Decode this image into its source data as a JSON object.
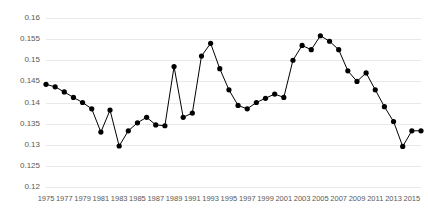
{
  "chart_data": {
    "type": "line",
    "title": "",
    "subtitle": "",
    "xlabel": "",
    "ylabel": "",
    "xlim": [
      1975,
      2016
    ],
    "ylim": [
      0.12,
      0.16
    ],
    "yticks": [
      0.12,
      0.125,
      0.13,
      0.135,
      0.14,
      0.145,
      0.15,
      0.155,
      0.16
    ],
    "ytick_labels": [
      "0.12",
      "0.125",
      "0.13",
      "0.135",
      "0.14",
      "0.145",
      "0.15",
      "0.155",
      "0.16"
    ],
    "xticks": [
      1975,
      1977,
      1979,
      1981,
      1983,
      1985,
      1987,
      1989,
      1991,
      1993,
      1995,
      1997,
      1999,
      2001,
      2003,
      2005,
      2007,
      2009,
      2011,
      2013,
      2015
    ],
    "xtick_labels": [
      "1975",
      "1977",
      "1979",
      "1981",
      "1983",
      "1985",
      "1987",
      "1989",
      "1991",
      "1993",
      "1995",
      "1997",
      "1999",
      "2001",
      "2003",
      "2005",
      "2007",
      "2009",
      "2011",
      "2013",
      "2015"
    ],
    "grid": true,
    "grid_axis": "y",
    "legend": false,
    "legend_position": "none",
    "marker": "circle",
    "line_color": "#000000",
    "marker_color": "#000000",
    "grid_color": "#e9e9e9",
    "background_color": "#ffffff",
    "tick_label_color": "#595959",
    "x": [
      1975,
      1976,
      1977,
      1978,
      1979,
      1980,
      1981,
      1982,
      1983,
      1984,
      1985,
      1986,
      1987,
      1988,
      1989,
      1990,
      1991,
      1992,
      1993,
      1994,
      1995,
      1996,
      1997,
      1998,
      1999,
      2000,
      2001,
      2002,
      2003,
      2004,
      2005,
      2006,
      2007,
      2008,
      2009,
      2010,
      2011,
      2012,
      2013,
      2014,
      2015,
      2016
    ],
    "values": [
      0.1443,
      0.1437,
      0.1425,
      0.1412,
      0.14,
      0.1385,
      0.133,
      0.1382,
      0.1297,
      0.1333,
      0.1352,
      0.1365,
      0.1347,
      0.1345,
      0.1485,
      0.1365,
      0.1375,
      0.151,
      0.154,
      0.148,
      0.143,
      0.1393,
      0.1385,
      0.14,
      0.141,
      0.142,
      0.1412,
      0.15,
      0.1535,
      0.1525,
      0.1558,
      0.1545,
      0.1525,
      0.1475,
      0.145,
      0.147,
      0.143,
      0.139,
      0.1355,
      0.1296,
      0.1333,
      0.1333
    ],
    "series": [
      {
        "name": "series-1",
        "values": [
          0.1443,
          0.1437,
          0.1425,
          0.1412,
          0.14,
          0.1385,
          0.133,
          0.1382,
          0.1297,
          0.1333,
          0.1352,
          0.1365,
          0.1347,
          0.1345,
          0.1485,
          0.1365,
          0.1375,
          0.151,
          0.154,
          0.148,
          0.143,
          0.1393,
          0.1385,
          0.14,
          0.141,
          0.142,
          0.1412,
          0.15,
          0.1535,
          0.1525,
          0.1558,
          0.1545,
          0.1525,
          0.1475,
          0.145,
          0.147,
          0.143,
          0.139,
          0.1355,
          0.1296,
          0.1333,
          0.1333
        ]
      }
    ]
  }
}
